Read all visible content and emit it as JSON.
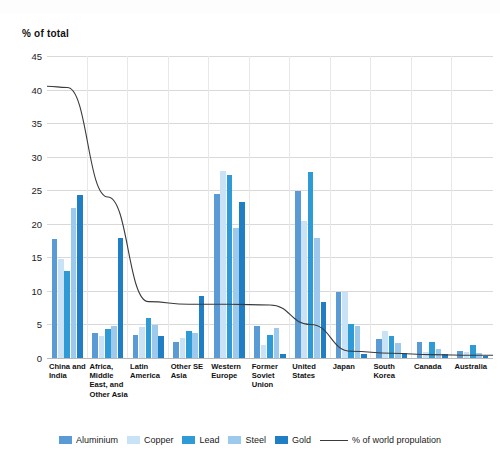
{
  "chart_data": {
    "type": "bar",
    "title": "",
    "subtitle": "",
    "ylabel": "% of total",
    "xlabel": "",
    "ylim": [
      0,
      45
    ],
    "yticks": [
      0,
      5,
      10,
      15,
      20,
      25,
      30,
      35,
      40,
      45
    ],
    "grid": true,
    "legend_position": "bottom",
    "categories": [
      "China and India",
      "Africa, Middle East, and Other Asia",
      "Latin America",
      "Other SE Asia",
      "Western Europe",
      "Former Soviet Union",
      "United States",
      "Japan",
      "South Korea",
      "Canada",
      "Australia"
    ],
    "category_labels": [
      "China and India",
      "Africa, Middle East, and Other Asia",
      "Latin America",
      "Other SE Asia",
      "Western Europe",
      "Former Soviet Union",
      "United States",
      "Japan",
      "South Korea",
      "Canada",
      "Australia"
    ],
    "series": [
      {
        "name": "Aluminium",
        "color": "#5b9bd5",
        "values": [
          17.8,
          3.7,
          3.5,
          2.4,
          24.4,
          4.8,
          24.9,
          9.9,
          2.8,
          2.4,
          1.0
        ]
      },
      {
        "name": "Copper",
        "color": "#c9e2f6",
        "values": [
          14.7,
          3.3,
          4.6,
          3.0,
          27.8,
          2.0,
          20.4,
          9.9,
          4.0,
          0.9,
          0.9
        ]
      },
      {
        "name": "Lead",
        "color": "#2e9bd6",
        "values": [
          13.0,
          4.3,
          6.0,
          4.1,
          27.2,
          3.5,
          27.7,
          5.0,
          3.3,
          2.4,
          2.0
        ]
      },
      {
        "name": "Steel",
        "color": "#9dc9ec",
        "values": [
          22.3,
          4.8,
          4.9,
          3.8,
          19.3,
          4.5,
          17.9,
          4.8,
          2.2,
          1.4,
          0.8
        ]
      },
      {
        "name": "Gold",
        "color": "#1f7ec4",
        "values": [
          24.3,
          17.9,
          3.3,
          9.3,
          23.3,
          0.6,
          8.3,
          0.6,
          0.8,
          0.6,
          0.3
        ]
      }
    ],
    "line_series": {
      "name": "% of world propulation",
      "color": "#3a3a3a",
      "values": [
        40.3,
        24.0,
        8.4,
        8.0,
        8.0,
        7.9,
        5.0,
        1.0,
        0.7,
        0.5,
        0.4
      ]
    }
  },
  "legend": {
    "items": [
      {
        "label": "Aluminium",
        "color": "#5b9bd5",
        "marker": "swatch"
      },
      {
        "label": "Copper",
        "color": "#c9e2f6",
        "marker": "swatch"
      },
      {
        "label": "Lead",
        "color": "#2e9bd6",
        "marker": "swatch"
      },
      {
        "label": "Steel",
        "color": "#9dc9ec",
        "marker": "swatch"
      },
      {
        "label": "Gold",
        "color": "#1f7ec4",
        "marker": "swatch"
      },
      {
        "label": "% of world propulation",
        "color": "#3a3a3a",
        "marker": "line"
      }
    ]
  }
}
